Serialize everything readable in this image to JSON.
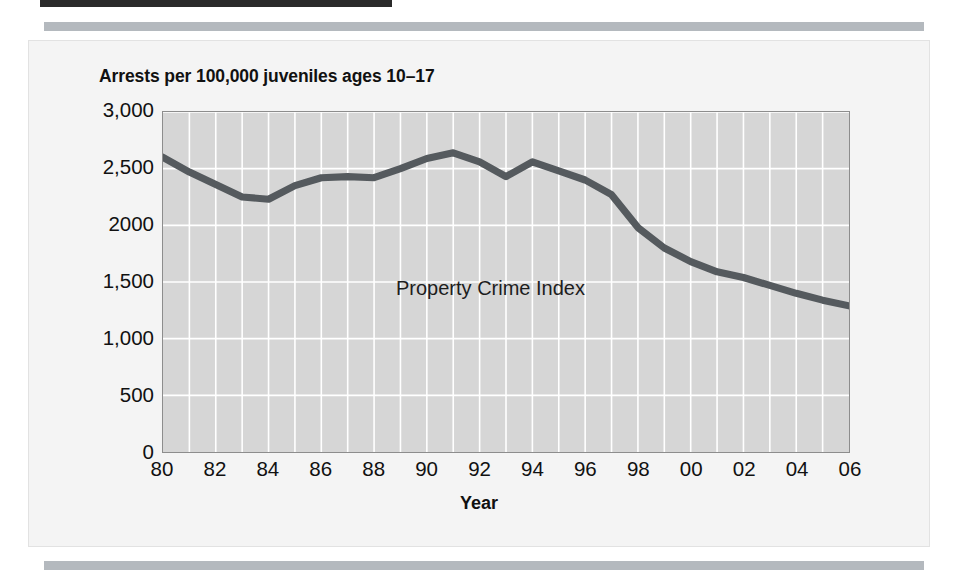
{
  "figure": {
    "title": "Arrests per 100,000 juveniles ages 10–17",
    "annotation": "Property Crime Index",
    "x_axis_title": "Year",
    "line_color": "#555a5e",
    "plot_background": "#d6d6d6",
    "gridline_color": "#ffffff",
    "panel_background": "#f4f4f4",
    "rule_color": "#b4b9be"
  },
  "chart_data": {
    "type": "line",
    "title": "Arrests per 100,000 juveniles ages 10–17",
    "xlabel": "Year",
    "ylabel": "",
    "xlim": [
      1980,
      2006
    ],
    "ylim": [
      0,
      3000
    ],
    "grid": true,
    "legend": "none",
    "annotations": [
      {
        "text": "Property Crime Index",
        "x": 1990,
        "y": 1800
      }
    ],
    "y_ticks": [
      0,
      500,
      1000,
      1500,
      2000,
      2500,
      3000
    ],
    "y_tick_labels": [
      "0",
      "500",
      "1,000",
      "1,500",
      "2000",
      "2,500",
      "3,000"
    ],
    "x_ticks": [
      1980,
      1982,
      1984,
      1986,
      1988,
      1990,
      1992,
      1994,
      1996,
      1998,
      2000,
      2002,
      2004,
      2006
    ],
    "x_tick_labels": [
      "80",
      "82",
      "84",
      "86",
      "88",
      "90",
      "92",
      "94",
      "96",
      "98",
      "00",
      "02",
      "04",
      "06"
    ],
    "series": [
      {
        "name": "Property Crime Index",
        "x": [
          1980,
          1981,
          1982,
          1983,
          1984,
          1985,
          1986,
          1987,
          1988,
          1989,
          1990,
          1991,
          1992,
          1993,
          1994,
          1995,
          1996,
          1997,
          1998,
          1999,
          2000,
          2001,
          2002,
          2003,
          2004,
          2005,
          2006
        ],
        "values": [
          2600,
          2470,
          2360,
          2250,
          2230,
          2350,
          2420,
          2430,
          2420,
          2500,
          2590,
          2640,
          2560,
          2430,
          2560,
          2480,
          2400,
          2270,
          1980,
          1800,
          1680,
          1590,
          1540,
          1470,
          1400,
          1340,
          1290
        ]
      }
    ]
  }
}
